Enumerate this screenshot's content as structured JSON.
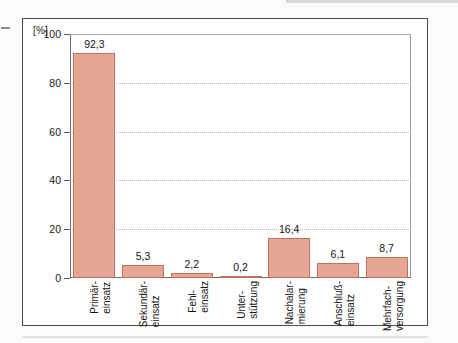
{
  "chart_data": {
    "type": "bar",
    "title": "",
    "subtitle": "",
    "xlabel": "",
    "ylabel": "[%]",
    "ylim": [
      0,
      100
    ],
    "yticks": [
      0,
      20,
      40,
      60,
      80,
      100
    ],
    "ytick_labels": [
      "0",
      "20",
      "40",
      "60",
      "80",
      "100"
    ],
    "grid": true,
    "legend": "none",
    "categories": [
      "Primär-einsatz",
      "Sekundär-einsatz",
      "Fehl-einsatz",
      "Unter-stützung",
      "Nachalar-mierung",
      "Anschluß-einsatz",
      "Mehrfach-versorgung"
    ],
    "category_lines": [
      {
        "line1": "Primär-",
        "line2": "einsatz"
      },
      {
        "line1": "Sekundär-",
        "line2": "einsatz"
      },
      {
        "line1": "Fehl-",
        "line2": "einsatz"
      },
      {
        "line1": "Unter-",
        "line2": "stützung"
      },
      {
        "line1": "Nachalar-",
        "line2": "mierung"
      },
      {
        "line1": "Anschluß-",
        "line2": "einsatz"
      },
      {
        "line1": "Mehrfach-",
        "line2": "versorgung"
      }
    ],
    "values": [
      92.3,
      5.3,
      2.2,
      0.2,
      16.4,
      6.1,
      8.7
    ],
    "value_labels": [
      "92,3",
      "5,3",
      "2,2",
      "0,2",
      "16,4",
      "6,1",
      "8,7"
    ],
    "bar_fill_color": "#e7a593",
    "bar_border_color": "#c0705d",
    "axis_color": "#5a5a5a",
    "grid_color": "#b9b9b9"
  }
}
